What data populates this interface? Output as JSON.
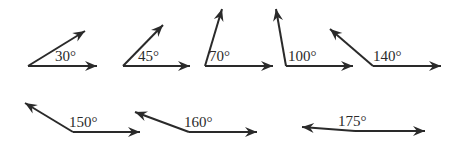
{
  "colors": {
    "stroke": "#2a2a2a",
    "background": "#ffffff"
  },
  "angles": [
    {
      "label": "30°",
      "degrees": 30,
      "vertex": [
        28,
        66
      ],
      "base_end": [
        97,
        66
      ],
      "ray_end": [
        85,
        31
      ],
      "label_pos": [
        55,
        49
      ]
    },
    {
      "label": "45°",
      "degrees": 45,
      "vertex": [
        123,
        66
      ],
      "base_end": [
        190,
        66
      ],
      "ray_end": [
        163,
        25
      ],
      "label_pos": [
        138,
        49
      ]
    },
    {
      "label": "70°",
      "degrees": 70,
      "vertex": [
        205,
        66
      ],
      "base_end": [
        273,
        66
      ],
      "ray_end": [
        222,
        9
      ],
      "label_pos": [
        209,
        49
      ]
    },
    {
      "label": "100°",
      "degrees": 100,
      "vertex": [
        286,
        66
      ],
      "base_end": [
        353,
        66
      ],
      "ray_end": [
        276,
        9
      ],
      "label_pos": [
        288,
        49
      ]
    },
    {
      "label": "140°",
      "degrees": 140,
      "vertex": [
        373,
        66
      ],
      "base_end": [
        441,
        66
      ],
      "ray_end": [
        330,
        29
      ],
      "label_pos": [
        373,
        49
      ]
    },
    {
      "label": "150°",
      "degrees": 150,
      "vertex": [
        73,
        132
      ],
      "base_end": [
        140,
        132
      ],
      "ray_end": [
        25,
        103
      ],
      "label_pos": [
        69,
        115
      ]
    },
    {
      "label": "160°",
      "degrees": 160,
      "vertex": [
        189,
        132
      ],
      "base_end": [
        257,
        132
      ],
      "ray_end": [
        135,
        112
      ],
      "label_pos": [
        184,
        115
      ]
    },
    {
      "label": "175°",
      "degrees": 175,
      "vertex": [
        355,
        131
      ],
      "base_end": [
        425,
        131
      ],
      "ray_end": [
        302,
        127
      ],
      "label_pos": [
        338,
        114
      ]
    }
  ]
}
